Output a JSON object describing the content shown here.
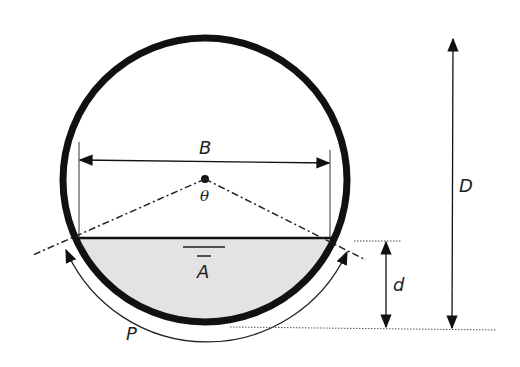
{
  "diagram": {
    "labels": {
      "top_width": "B",
      "angle": "θ",
      "area": "A",
      "wetted_perimeter": "P",
      "depth": "d",
      "diameter": "D"
    },
    "colors": {
      "pipe_wall": "#111111",
      "water_fill": "#e3e3e3",
      "lines": "#222222"
    }
  }
}
